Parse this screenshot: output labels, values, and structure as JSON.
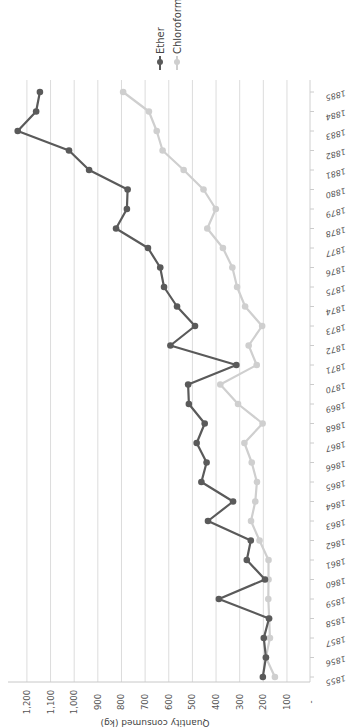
{
  "chart_data": {
    "type": "line",
    "title": "",
    "xlabel": "",
    "ylabel": "Quantity consumed (kg)",
    "ylim": [
      0,
      1250
    ],
    "yticks": [
      "-",
      "100",
      "200",
      "300",
      "400",
      "500",
      "600",
      "700",
      "800",
      "900",
      "1,000",
      "1,100",
      "1,200"
    ],
    "grid": true,
    "legend_position": "top",
    "x": [
      1855,
      1856,
      1857,
      1858,
      1859,
      1860,
      1861,
      1862,
      1863,
      1864,
      1865,
      1866,
      1867,
      1868,
      1869,
      1870,
      1871,
      1872,
      1873,
      1874,
      1875,
      1876,
      1877,
      1878,
      1879,
      1880,
      1881,
      1882,
      1883,
      1884,
      1885
    ],
    "series": [
      {
        "name": "Ether",
        "color": "#5a5a5a",
        "values": [
          202,
          189,
          198,
          176,
          388,
          193,
          270,
          253,
          434,
          328,
          462,
          440,
          482,
          448,
          515,
          518,
          314,
          593,
          489,
          565,
          620,
          636,
          688,
          823,
          777,
          774,
          937,
          1022,
          1239,
          1161,
          1145
        ]
      },
      {
        "name": "Chloroform",
        "color": "#cfcfcf",
        "values": [
          151,
          189,
          172,
          175,
          179,
          178,
          178,
          216,
          252,
          234,
          227,
          249,
          280,
          203,
          307,
          382,
          228,
          262,
          205,
          277,
          311,
          331,
          371,
          437,
          401,
          453,
          537,
          626,
          651,
          684,
          793
        ]
      }
    ]
  }
}
